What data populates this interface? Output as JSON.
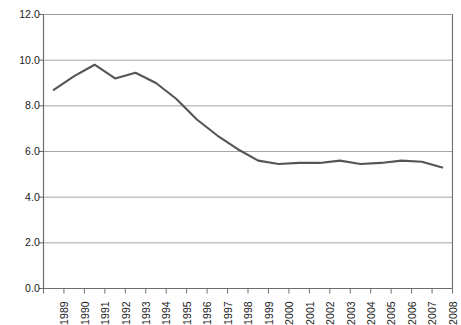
{
  "chart_data": {
    "type": "line",
    "title": "",
    "subtitle": "",
    "xlabel": "",
    "ylabel": "",
    "categories": [
      "1989",
      "1990",
      "1991",
      "1992",
      "1993",
      "1994",
      "1995",
      "1996",
      "1997",
      "1998",
      "1999",
      "2000",
      "2001",
      "2002",
      "2003",
      "2004",
      "2005",
      "2006",
      "2007",
      "2008"
    ],
    "x": [
      1989,
      1990,
      1991,
      1992,
      1993,
      1994,
      1995,
      1996,
      1997,
      1998,
      1999,
      2000,
      2001,
      2002,
      2003,
      2004,
      2005,
      2006,
      2007,
      2008
    ],
    "values": [
      8.7,
      9.3,
      9.8,
      9.2,
      9.45,
      9.0,
      8.3,
      7.4,
      6.7,
      6.1,
      5.6,
      5.45,
      5.5,
      5.5,
      5.6,
      5.45,
      5.5,
      5.6,
      5.55,
      5.3
    ],
    "series": [
      {
        "name": "series-1",
        "color": "#555555",
        "values": [
          8.7,
          9.3,
          9.8,
          9.2,
          9.45,
          9.0,
          8.3,
          7.4,
          6.7,
          6.1,
          5.6,
          5.45,
          5.5,
          5.5,
          5.6,
          5.45,
          5.5,
          5.6,
          5.55,
          5.3
        ]
      }
    ],
    "ylim": [
      0.0,
      12.0
    ],
    "yticks": [
      0.0,
      2.0,
      4.0,
      6.0,
      8.0,
      10.0,
      12.0
    ],
    "ytick_labels": [
      "0.0",
      "2.0",
      "4.0",
      "6.0",
      "8.0",
      "10.0",
      "12.0"
    ],
    "grid": true,
    "grid_axis": "y",
    "legend": false,
    "legend_position": "none",
    "annotations": []
  },
  "style": {
    "line_color": "#555555",
    "grid_color": "#9a9a9a",
    "axis_color": "#6e6e6e",
    "text_color": "#1a1a1a",
    "background": "#ffffff"
  }
}
